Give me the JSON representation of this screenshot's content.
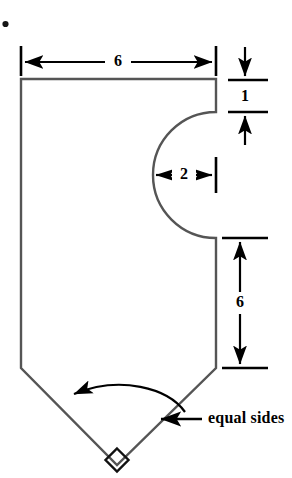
{
  "figure": {
    "background_color": "#ffffff",
    "outline_color": "#555555",
    "annotation_color": "#000000",
    "dimensions": {
      "top_width": "6",
      "upper_right_segment": "1",
      "notch_radius": "2",
      "lower_right_segment": "6"
    },
    "callout": {
      "text": "equal sides"
    },
    "markers": {
      "right_angle": "right-angle-square",
      "stray_dot": "•"
    }
  }
}
